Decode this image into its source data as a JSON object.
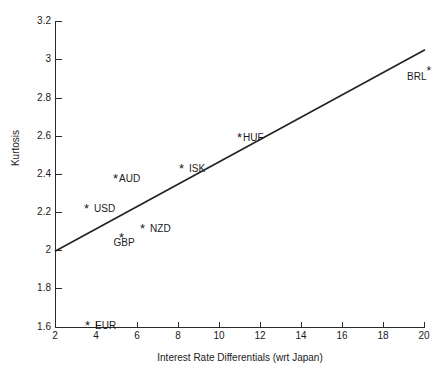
{
  "chart_data": {
    "type": "scatter",
    "title": "",
    "xlabel": "Interest Rate Differentials (wrt Japan)",
    "ylabel": "Kurtosis",
    "xlim": [
      2,
      20
    ],
    "ylim": [
      1.6,
      3.2
    ],
    "xticks": [
      "2",
      "4",
      "6",
      "8",
      "10",
      "12",
      "14",
      "16",
      "18",
      "20"
    ],
    "xtick_values": [
      2,
      4,
      6,
      8,
      10,
      12,
      14,
      16,
      18,
      20
    ],
    "yticks": [
      "1.6",
      "1.8",
      "2",
      "2.2",
      "2.4",
      "2.6",
      "2.8",
      "3",
      "3.2"
    ],
    "ytick_values": [
      1.6,
      1.8,
      2.0,
      2.2,
      2.4,
      2.6,
      2.8,
      3.0,
      3.2
    ],
    "grid": false,
    "legend": "none",
    "marker_glyph": "✳",
    "series": [
      {
        "name": "Currencies",
        "points": [
          {
            "label": "EUR",
            "x": 2.7,
            "y": 1.71,
            "label_pos": "right"
          },
          {
            "label": "USD",
            "x": 3.4,
            "y": 2.32,
            "label_pos": "right"
          },
          {
            "label": "AUD",
            "x": 4.8,
            "y": 2.46,
            "label_pos": "right-tight"
          },
          {
            "label": "GBP",
            "x": 5.1,
            "y": 2.07,
            "label_pos": "below"
          },
          {
            "label": "NZD",
            "x": 6.1,
            "y": 2.12,
            "label_pos": "right"
          },
          {
            "label": "ISK",
            "x": 8.0,
            "y": 2.42,
            "label_pos": "right"
          },
          {
            "label": "HUF",
            "x": 11.0,
            "y": 2.58,
            "label_pos": "right-tight"
          },
          {
            "label": "BRL",
            "x": 20.4,
            "y": 2.88,
            "label_pos": "left-sup"
          }
        ]
      }
    ],
    "fit_line": {
      "name": "linear-fit",
      "x0": 2.0,
      "y0": 2.0,
      "x1": 20.0,
      "y1": 3.05,
      "slope": 0.0583,
      "intercept": 1.8833,
      "color": "#222222"
    },
    "colors": {
      "axis": "#2a2a2a",
      "text": "#1a1a1a",
      "marker": "#1a1a1a",
      "line": "#222222",
      "background": "#ffffff"
    }
  }
}
